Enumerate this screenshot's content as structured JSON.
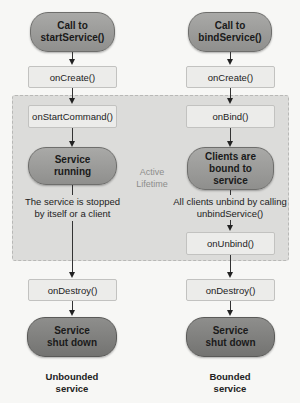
{
  "lifetime": {
    "label_line1": "Active",
    "label_line2": "Lifetime"
  },
  "left": {
    "start": {
      "line1": "Call to",
      "line2": "startService()"
    },
    "on_create": "onCreate()",
    "on_start_command": "onStartCommand()",
    "running": {
      "line1": "Service",
      "line2": "running"
    },
    "stop_note": {
      "line1": "The service is stopped",
      "line2": "by itself or a client"
    },
    "on_destroy": "onDestroy()",
    "shutdown": {
      "line1": "Service",
      "line2": "shut down"
    },
    "caption": {
      "line1": "Unbounded",
      "line2": "service"
    }
  },
  "right": {
    "start": {
      "line1": "Call to",
      "line2": "bindService()"
    },
    "on_create": "onCreate()",
    "on_bind": "onBind()",
    "bound": {
      "line1": "Clients are",
      "line2": "bound to",
      "line3": "service"
    },
    "unbind_note": {
      "line1": "All clients unbind by calling",
      "line2": "unbindService()"
    },
    "on_unbind": "onUnbind()",
    "on_destroy": "onDestroy()",
    "shutdown": {
      "line1": "Service",
      "line2": "shut down"
    },
    "caption": {
      "line1": "Bounded",
      "line2": "service"
    }
  }
}
